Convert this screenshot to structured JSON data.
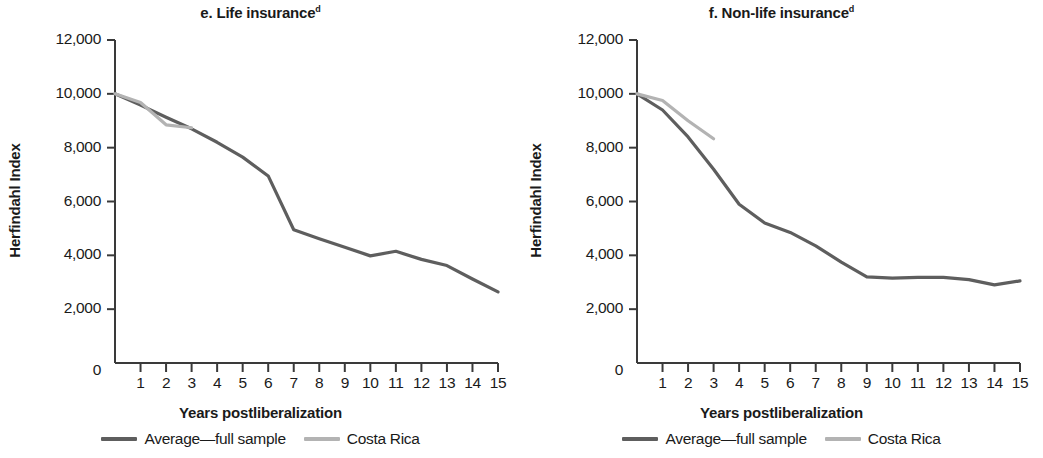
{
  "figure": {
    "colors": {
      "average_line": "#5e5e5e",
      "costa_rica_line": "#b3b3b3",
      "axis": "#3a3a3a",
      "text": "#1a1a1a"
    }
  },
  "panels": [
    {
      "key": "life",
      "title_text": "e. Life insurance",
      "title_superscript": "d",
      "ylabel": "Herfindahl Index",
      "xlabel": "Years postliberalization",
      "ytick_labels": [
        "12,000",
        "10,000",
        "8,000",
        "6,000",
        "4,000",
        "2,000",
        "0"
      ],
      "xtick_labels": [
        "1",
        "2",
        "3",
        "4",
        "5",
        "6",
        "7",
        "8",
        "9",
        "10",
        "11",
        "12",
        "13",
        "14",
        "15"
      ],
      "legend": [
        {
          "label": "Average—full sample",
          "color": "#5e5e5e"
        },
        {
          "label": "Costa Rica",
          "color": "#b3b3b3"
        }
      ]
    },
    {
      "key": "nonlife",
      "title_text": "f. Non-life insurance",
      "title_superscript": "d",
      "ylabel": "Herfindahl Index",
      "xlabel": "Years postliberalization",
      "ytick_labels": [
        "12,000",
        "10,000",
        "8,000",
        "6,000",
        "4,000",
        "2,000",
        "0"
      ],
      "xtick_labels": [
        "1",
        "2",
        "3",
        "4",
        "5",
        "6",
        "7",
        "8",
        "9",
        "10",
        "11",
        "12",
        "13",
        "14",
        "15"
      ],
      "legend": [
        {
          "label": "Average—full sample",
          "color": "#5e5e5e"
        },
        {
          "label": "Costa Rica",
          "color": "#b3b3b3"
        }
      ]
    }
  ],
  "chart_data": [
    {
      "type": "line",
      "panel": "e",
      "title": "e. Life insurance",
      "title_note": "d",
      "xlabel": "Years postliberalization",
      "ylabel": "Herfindahl Index",
      "xlim": [
        0,
        15
      ],
      "ylim": [
        0,
        12000
      ],
      "yticks": [
        0,
        2000,
        4000,
        6000,
        8000,
        10000,
        12000
      ],
      "xticks": [
        1,
        2,
        3,
        4,
        5,
        6,
        7,
        8,
        9,
        10,
        11,
        12,
        13,
        14,
        15
      ],
      "grid": false,
      "legend_position": "bottom",
      "series": [
        {
          "name": "Average—full sample",
          "color": "#5e5e5e",
          "x": [
            0,
            1,
            2,
            3,
            4,
            5,
            6,
            7,
            8,
            9,
            10,
            11,
            12,
            13,
            14,
            15
          ],
          "values": [
            10000,
            9580,
            9130,
            8700,
            8200,
            7650,
            6950,
            4950,
            4620,
            4300,
            3980,
            4150,
            3850,
            3620,
            3120,
            2640
          ]
        },
        {
          "name": "Costa Rica",
          "color": "#b3b3b3",
          "x": [
            0,
            1,
            2,
            3
          ],
          "values": [
            10000,
            9680,
            8850,
            8740
          ]
        }
      ]
    },
    {
      "type": "line",
      "panel": "f",
      "title": "f. Non-life insurance",
      "title_note": "d",
      "xlabel": "Years postliberalization",
      "ylabel": "Herfindahl Index",
      "xlim": [
        0,
        15
      ],
      "ylim": [
        0,
        12000
      ],
      "yticks": [
        0,
        2000,
        4000,
        6000,
        8000,
        10000,
        12000
      ],
      "xticks": [
        1,
        2,
        3,
        4,
        5,
        6,
        7,
        8,
        9,
        10,
        11,
        12,
        13,
        14,
        15
      ],
      "grid": false,
      "legend_position": "bottom",
      "series": [
        {
          "name": "Average—full sample",
          "color": "#5e5e5e",
          "x": [
            0,
            1,
            2,
            3,
            4,
            5,
            6,
            7,
            8,
            9,
            10,
            11,
            12,
            13,
            14,
            15
          ],
          "values": [
            10000,
            9400,
            8400,
            7200,
            5900,
            5200,
            4850,
            4350,
            3750,
            3200,
            3150,
            3180,
            3180,
            3100,
            2900,
            3050
          ]
        },
        {
          "name": "Costa Rica",
          "color": "#b3b3b3",
          "x": [
            0,
            1,
            2,
            3
          ],
          "values": [
            10000,
            9750,
            9000,
            8330
          ]
        }
      ]
    }
  ]
}
